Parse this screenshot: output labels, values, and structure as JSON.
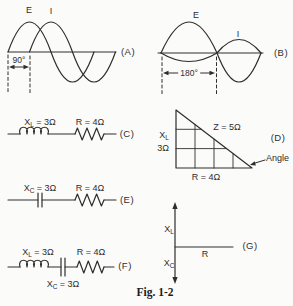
{
  "colors": {
    "ink": "#2e2e2e",
    "paper": "#fbfbfa"
  },
  "caption": "Fig. 1-2",
  "panel_a": {
    "label": "(A)",
    "e": "E",
    "i": "I",
    "phase": "90°"
  },
  "panel_b": {
    "label": "(B)",
    "e": "E",
    "i": "I",
    "phase": "180°"
  },
  "panel_c": {
    "label": "(C)",
    "xl": {
      "base": "X",
      "sub": "L",
      "rest": " = 3Ω"
    },
    "r": "R = 4Ω"
  },
  "panel_d": {
    "label": "(D)",
    "xl": {
      "base": "X",
      "sub": "L"
    },
    "xl_value": "3Ω",
    "z": "Z = 5Ω",
    "r": "R = 4Ω",
    "angle": "Angle"
  },
  "panel_e": {
    "label": "(E)",
    "xc": {
      "base": "X",
      "sub": "C",
      "rest": " = 3Ω"
    },
    "r": "R = 4Ω"
  },
  "panel_f": {
    "label": "(F)",
    "xl": {
      "base": "X",
      "sub": "L",
      "rest": " = 3Ω"
    },
    "xc": {
      "base": "X",
      "sub": "C",
      "rest": " = 3Ω"
    },
    "r": "R = 4Ω"
  },
  "panel_g": {
    "label": "(G)",
    "xl": {
      "base": "X",
      "sub": "L"
    },
    "xc": {
      "base": "X",
      "sub": "C"
    },
    "r": "R"
  }
}
